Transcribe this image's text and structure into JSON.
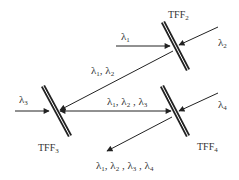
{
  "diagram": {
    "type": "optical-multiplexer",
    "colors": {
      "line": "#222222",
      "text": "#333333",
      "background": "#ffffff"
    },
    "filters": [
      {
        "id": "tff2",
        "label": "TFF",
        "sub": "2"
      },
      {
        "id": "tff3",
        "label": "TFF",
        "sub": "3"
      },
      {
        "id": "tff4",
        "label": "TFF",
        "sub": "4"
      }
    ],
    "signals": {
      "l1": {
        "sym": "λ",
        "sub": "1"
      },
      "l2": {
        "sym": "λ",
        "sub": "2"
      },
      "l3": {
        "sym": "λ",
        "sub": "3"
      },
      "l4": {
        "sym": "λ",
        "sub": "4"
      },
      "l12": {
        "parts": [
          {
            "sym": "λ",
            "sub": "1",
            "sep": ", "
          },
          {
            "sym": "λ",
            "sub": "2",
            "sep": ""
          }
        ]
      },
      "l123": {
        "parts": [
          {
            "sym": "λ",
            "sub": "1",
            "sep": ", "
          },
          {
            "sym": "λ",
            "sub": "2",
            "sep": " , "
          },
          {
            "sym": "λ",
            "sub": "3",
            "sep": ""
          }
        ]
      },
      "l1234": {
        "parts": [
          {
            "sym": "λ",
            "sub": "1",
            "sep": ", "
          },
          {
            "sym": "λ",
            "sub": "2",
            "sep": " , "
          },
          {
            "sym": "λ",
            "sub": "3",
            "sep": " , "
          },
          {
            "sym": "λ",
            "sub": "4",
            "sep": ""
          }
        ]
      }
    }
  }
}
